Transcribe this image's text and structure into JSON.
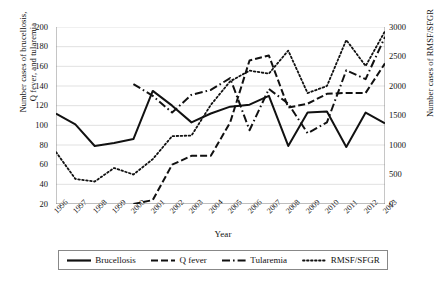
{
  "chart_data": {
    "type": "line",
    "title": "",
    "xlabel": "Year",
    "ylabel": "Number cases of brucellosis, Q fever, and tularemia",
    "ylabel_right": "Number cases of RMSF/SFGR",
    "x": [
      1996,
      1997,
      1998,
      1999,
      2000,
      2001,
      2002,
      2003,
      2004,
      2005,
      2006,
      2007,
      2008,
      2009,
      2010,
      2011,
      2012,
      2013
    ],
    "xticklabels": [
      "1996",
      "1997",
      "1998",
      "1999",
      "2000",
      "2001",
      "2002",
      "2003",
      "2004",
      "2005",
      "2006",
      "2007",
      "2008",
      "2009",
      "2010",
      "2011",
      "2012",
      "2013"
    ],
    "ylim": [
      20,
      200
    ],
    "yticks": [
      20,
      40,
      60,
      80,
      100,
      120,
      140,
      160,
      180,
      200
    ],
    "yticklabels": [
      "20",
      "40",
      "60",
      "80",
      "100",
      "120",
      "140",
      "160",
      "180",
      "200"
    ],
    "ylim_right": [
      0,
      3000
    ],
    "yticks_right": [
      0,
      500,
      1000,
      1500,
      2000,
      2500,
      3000
    ],
    "yticklabels_right": [
      "0",
      "500",
      "1000",
      "1500",
      "2000",
      "2500",
      "3000"
    ],
    "grid": true,
    "legend_position": "bottom",
    "series": [
      {
        "name": "Brucellosis",
        "axis": "left",
        "style": "solid",
        "values": [
          112,
          101,
          79,
          82,
          86,
          135,
          120,
          103,
          112,
          119,
          121,
          130,
          79,
          113,
          114,
          78,
          113,
          102
        ]
      },
      {
        "name": "Q fever",
        "axis": "left",
        "style": "dashed",
        "values": [
          null,
          null,
          null,
          null,
          20,
          24,
          60,
          69,
          69,
          103,
          166,
          171,
          118,
          122,
          132,
          133,
          133,
          163
        ]
      },
      {
        "name": "Tularemia",
        "axis": "left",
        "style": "dashdot",
        "values": [
          null,
          null,
          null,
          null,
          142,
          130,
          113,
          131,
          136,
          148,
          95,
          137,
          122,
          92,
          103,
          156,
          147,
          190
        ]
      },
      {
        "name": "RMSF/SFGR",
        "axis": "right",
        "style": "dotted",
        "values": [
          880,
          425,
          380,
          610,
          500,
          760,
          1150,
          1160,
          1680,
          2080,
          2260,
          2210,
          2600,
          1880,
          2000,
          2780,
          2340,
          2930
        ]
      }
    ]
  },
  "axes": {
    "left_title": "Number cases of brucellosis,\nQ fever, and tularemia",
    "left_title_line1": "Number cases of brucellosis,",
    "left_title_line2": "Q fever, and tularemia",
    "right_title": "Number cases of RMSF/SFGR",
    "x_title": "Year"
  },
  "legend": {
    "items": [
      {
        "label": "Brucellosis",
        "style": "solid"
      },
      {
        "label": "Q fever",
        "style": "dashed"
      },
      {
        "label": "Tularemia",
        "style": "dashdot"
      },
      {
        "label": "RMSF/SFGR",
        "style": "dotted"
      }
    ]
  },
  "colors": {
    "line": "#111111",
    "grid": "#d9d9d9",
    "axis": "#808080",
    "background": "#ffffff"
  }
}
